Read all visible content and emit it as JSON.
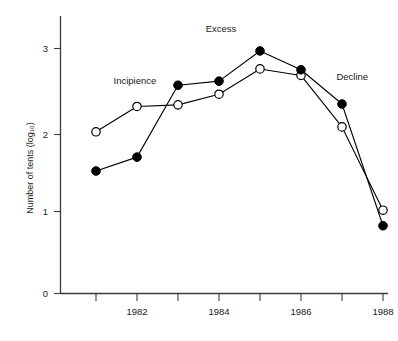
{
  "chart_data": {
    "type": "line",
    "title": "",
    "xlabel": "",
    "ylabel": "Number of tents (log₁₀)",
    "x": [
      1981,
      1982,
      1983,
      1984,
      1985,
      1986,
      1987,
      1988
    ],
    "xtick_values": [
      1981,
      1982,
      1983,
      1984,
      1985,
      1986,
      1987,
      1988
    ],
    "xtick_labels": [
      "",
      "1982",
      "",
      "1984",
      "",
      "1986",
      "",
      "1988"
    ],
    "ytick_values": [
      0,
      1,
      2,
      3
    ],
    "ytick_labels": [
      "0",
      "1",
      "2",
      "3"
    ],
    "xlim": [
      1980.5,
      1988.7
    ],
    "ylim": [
      0,
      3.35
    ],
    "grid": false,
    "legend": "none",
    "series": [
      {
        "name": "filled-circles",
        "marker": "filled-circle",
        "color": "#000000",
        "values": [
          1.5,
          1.67,
          2.55,
          2.6,
          2.97,
          2.74,
          2.32,
          0.83
        ]
      },
      {
        "name": "open-circles",
        "marker": "open-circle",
        "color": "#000000",
        "values": [
          1.98,
          2.29,
          2.31,
          2.44,
          2.75,
          2.67,
          2.04,
          1.02
        ]
      }
    ],
    "annotations": [
      {
        "text": "Incipience",
        "x": 1981.95,
        "y": 2.56
      },
      {
        "text": "Excess",
        "x": 1984.05,
        "y": 3.2
      },
      {
        "text": "Decline",
        "x": 1987.25,
        "y": 2.62
      }
    ]
  }
}
